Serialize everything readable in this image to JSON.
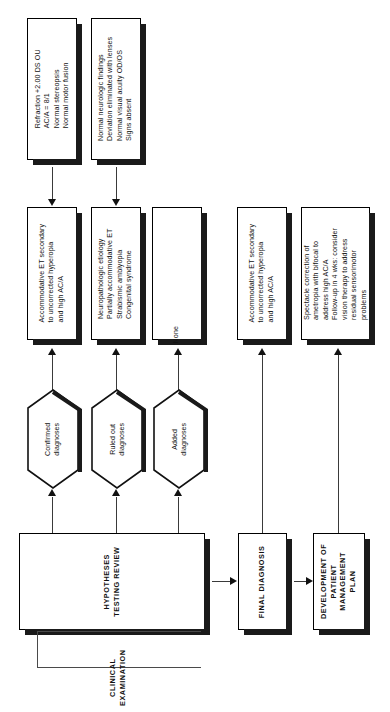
{
  "diagram": {
    "orientation": "rotated-90",
    "colors": {
      "ink": "#111111",
      "shadow": "#1a1a1a",
      "line": "#3a3a3a",
      "paper": "#ffffff"
    }
  },
  "findings": [
    {
      "id": "finding-refraction",
      "lines": [
        "Refraction +2.00 DS OU",
        "AC/A = 8/1",
        "Normal stereopsis",
        "Normal motor fusion"
      ]
    },
    {
      "id": "finding-neuro",
      "lines": [
        "Normal neurologic findings",
        "Deviation eliminated with lenses",
        "Normal visual acuity OD/OS",
        "Signs absent"
      ]
    }
  ],
  "outcomes": [
    {
      "id": "confirmed-outcome",
      "lines": [
        "Accommodative ET secondary",
        "to uncorrected hyperopia",
        "and high AC/A"
      ]
    },
    {
      "id": "ruled-out-outcome",
      "lines": [
        "Neuropathologic etiology",
        "Partially accommodative ET",
        "Strabismic amblyopia",
        "Congenital syndrome"
      ]
    },
    {
      "id": "added-outcome",
      "lines": [
        "None"
      ]
    },
    {
      "id": "final-diagnosis-outcome",
      "lines": [
        "Accommodative ET secondary",
        "to uncorrected hyperopia",
        "and high AC/A"
      ]
    },
    {
      "id": "management-plan-outcome",
      "lines": [
        "Spectacle correction of",
        "ametropia with bifocal to",
        "address high AC/A",
        "Follow-up in 4 wks: consider",
        "vision therapy to address",
        "residual sensorimotor",
        "problems"
      ]
    }
  ],
  "hexagons": [
    {
      "id": "confirmed",
      "lines": [
        "Confirmed",
        "diagnoses"
      ]
    },
    {
      "id": "ruled-out",
      "lines": [
        "Ruled out",
        "diagnoses"
      ]
    },
    {
      "id": "added",
      "lines": [
        "Added",
        "diagnoses"
      ]
    }
  ],
  "process": {
    "hypotheses_testing_review": [
      "HYPOTHESES",
      "TESTING REVIEW"
    ],
    "final_diagnosis": [
      "FINAL DIAGNOSIS"
    ],
    "management_plan": [
      "DEVELOPMENT OF",
      "PATIENT",
      "MANAGEMENT",
      "PLAN"
    ],
    "bracket_label": [
      "CLINICAL",
      "EXAMINATION"
    ]
  }
}
